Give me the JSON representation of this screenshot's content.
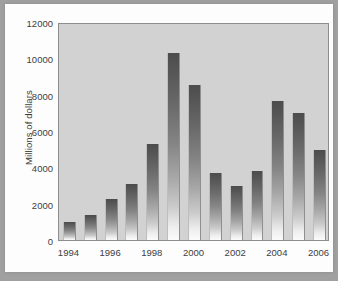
{
  "chart_data": {
    "type": "bar",
    "title": "",
    "xlabel": "",
    "ylabel": "Millions of dollars",
    "categories": [
      "1994",
      "1995",
      "1996",
      "1997",
      "1998",
      "1999",
      "2000",
      "2001",
      "2002",
      "2003",
      "2004",
      "2005",
      "2006"
    ],
    "values": [
      1000,
      1350,
      2250,
      3100,
      5300,
      10300,
      8550,
      3700,
      3000,
      3800,
      7650,
      7000,
      4950
    ],
    "ylim": [
      0,
      12000
    ],
    "yticks": [
      0,
      2000,
      4000,
      6000,
      8000,
      10000,
      12000
    ],
    "ytick_labels": [
      "0",
      "2000",
      "4000",
      "6000",
      "8000",
      "10000",
      "12000"
    ],
    "xtick_labels": [
      "1994",
      "1996",
      "1998",
      "2000",
      "2002",
      "2004",
      "2006"
    ],
    "xtick_categories": [
      "1994",
      "1996",
      "1998",
      "2000",
      "2002",
      "2004",
      "2006"
    ],
    "grid": false,
    "legend": null,
    "colors": {
      "plot_background": "#d2d2d2",
      "card_background": "#fdfdfd",
      "frame_background": "#a0a0a0",
      "bar_top": "#4c4c4c",
      "bar_bottom": "#fbfbfb",
      "axis_line": "#8e8e8e",
      "text": "#404040"
    }
  }
}
